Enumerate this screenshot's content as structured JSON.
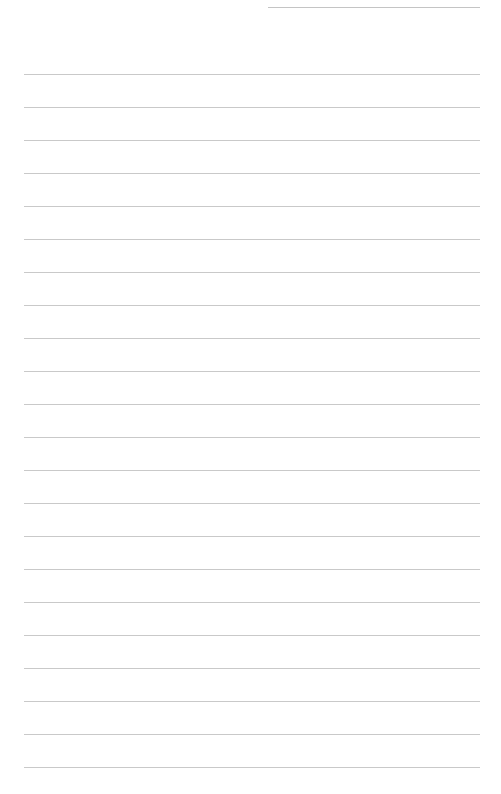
{
  "page": {
    "type": "lined-paper",
    "background_color": "#ffffff",
    "line_color": "#c9c9c9",
    "header_line": {
      "x": 268,
      "y": 7,
      "width": 212
    },
    "rules": {
      "count": 22,
      "first_y": 74,
      "spacing": 33,
      "x": 24,
      "width": 456
    }
  }
}
